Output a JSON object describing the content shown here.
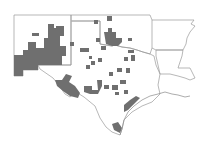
{
  "map": {
    "type": "choropleth",
    "style": "grayscale county shading",
    "region": "South-central United States",
    "states_outlined": [
      "New Mexico",
      "Texas",
      "Oklahoma",
      "Arkansas",
      "Louisiana"
    ],
    "colors": {
      "background": "#ffffff",
      "state_border": "#9a9a9a",
      "highlighted_county": "#6f6f6f"
    },
    "legend": null,
    "title": null
  }
}
